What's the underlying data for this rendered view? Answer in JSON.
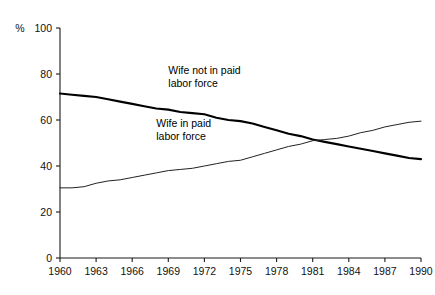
{
  "chart_data": {
    "type": "line",
    "title": "",
    "subtitle": "",
    "xlabel": "",
    "ylabel": "%",
    "xlim": [
      1960,
      1990
    ],
    "ylim": [
      0,
      100
    ],
    "grid": false,
    "legend_position": "inline-annotations",
    "x_ticks": [
      "1960",
      "1963",
      "1966",
      "1969",
      "1972",
      "1975",
      "1978",
      "1981",
      "1984",
      "1987",
      "1990"
    ],
    "x_tick_values": [
      1960,
      1963,
      1966,
      1969,
      1972,
      1975,
      1978,
      1981,
      1984,
      1987,
      1990
    ],
    "y_ticks": [
      "0",
      "20",
      "40",
      "60",
      "80",
      "100"
    ],
    "y_tick_values": [
      0,
      20,
      40,
      60,
      80,
      100
    ],
    "x": [
      1960,
      1961,
      1962,
      1963,
      1964,
      1965,
      1966,
      1967,
      1968,
      1969,
      1970,
      1971,
      1972,
      1973,
      1974,
      1975,
      1976,
      1977,
      1978,
      1979,
      1980,
      1981,
      1982,
      1983,
      1984,
      1985,
      1986,
      1987,
      1988,
      1989,
      1990
    ],
    "series": [
      {
        "name": "Wife not in paid labor force",
        "style": "thick",
        "color": "#000000",
        "values": [
          71.5,
          71.0,
          70.5,
          70.0,
          69.0,
          68.0,
          67.0,
          66.0,
          65.0,
          64.5,
          63.5,
          63.0,
          62.5,
          61.0,
          60.0,
          59.5,
          58.5,
          57.0,
          55.5,
          54.0,
          53.0,
          51.5,
          50.5,
          49.5,
          48.5,
          47.5,
          46.5,
          45.5,
          44.5,
          43.5,
          43.0
        ]
      },
      {
        "name": "Wife in paid labor force",
        "style": "thin",
        "color": "#222222",
        "values": [
          30.5,
          30.5,
          31.0,
          32.5,
          33.5,
          34.0,
          35.0,
          36.0,
          37.0,
          38.0,
          38.5,
          39.0,
          40.0,
          41.0,
          42.0,
          42.5,
          44.0,
          45.5,
          47.0,
          48.5,
          49.5,
          51.0,
          51.5,
          52.0,
          53.0,
          54.5,
          55.5,
          57.0,
          58.0,
          59.0,
          59.5
        ]
      }
    ],
    "annotations": [
      {
        "name": "wife-not-in-paid-labor-force-label",
        "line1": "Wife not in paid",
        "line2": "labor force",
        "x": 1969,
        "y": 80
      },
      {
        "name": "wife-in-paid-labor-force-label",
        "line1": "Wife in paid",
        "line2": "labor force",
        "x": 1968,
        "y": 57
      }
    ],
    "axis_unit_label": "%"
  }
}
